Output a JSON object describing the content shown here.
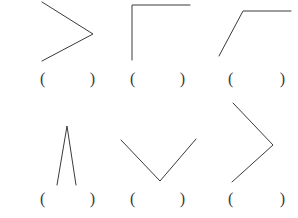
{
  "page": {
    "background_color": "#ffffff",
    "stroke_color": "#3a3a3a",
    "stroke_width": 1,
    "width": 298,
    "height": 218
  },
  "blank": {
    "open_paren": "(",
    "close_paren": ")",
    "fill_text": ""
  },
  "items": [
    {
      "id": "item-1",
      "row": 1,
      "column": 1,
      "shape_name": "greater-than-angle",
      "description": "Two segments meeting at a right-pointing vertex, forming a '>' shape",
      "points": "42,2 93,34 42,61",
      "blank": {
        "open_paren": "(",
        "close_paren": ")",
        "fill_text": ""
      }
    },
    {
      "id": "item-2",
      "row": 1,
      "column": 2,
      "shape_name": "right-angle-corner",
      "description": "Vertical segment and horizontal segment meeting at a square corner, opening down-right",
      "points": "132,60 132,5 190,5",
      "blank": {
        "open_paren": "(",
        "close_paren": ")",
        "fill_text": ""
      }
    },
    {
      "id": "item-3",
      "row": 1,
      "column": 3,
      "shape_name": "obtuse-angle-flag",
      "description": "Diagonal segment rising to a vertex then a horizontal segment to the right",
      "points": "219,56 243,11 291,11",
      "blank": {
        "open_paren": "(",
        "close_paren": ")",
        "fill_text": ""
      }
    },
    {
      "id": "item-4",
      "row": 2,
      "column": 1,
      "shape_name": "narrow-caret-angle",
      "description": "Two nearly vertical segments meeting at a sharp apex, forming a narrow inverted V",
      "points": "57,185 67,126 76,185",
      "blank": {
        "open_paren": "(",
        "close_paren": ")",
        "fill_text": ""
      }
    },
    {
      "id": "item-5",
      "row": 2,
      "column": 2,
      "shape_name": "wide-v-angle",
      "description": "Two segments meeting at a low vertex forming a wide V shape",
      "points": "121,140 160,181 196,139",
      "blank": {
        "open_paren": "(",
        "close_paren": ")",
        "fill_text": ""
      }
    },
    {
      "id": "item-6",
      "row": 2,
      "column": 3,
      "shape_name": "large-greater-than-angle",
      "description": "Two long segments meeting at a right-pointing vertex, larger '>' shape",
      "points": "233,103 273,145 232,182",
      "blank": {
        "open_paren": "(",
        "close_paren": ")",
        "fill_text": ""
      }
    }
  ]
}
